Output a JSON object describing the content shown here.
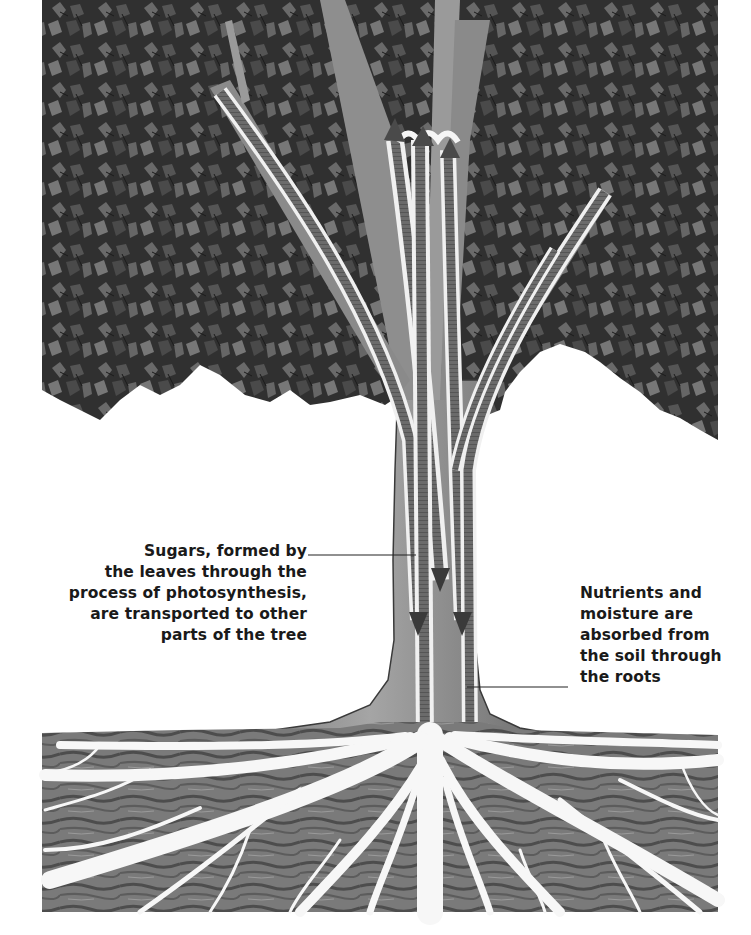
{
  "diagram": {
    "colors": {
      "background": "#ffffff",
      "canopy_dark": "#2a2a2a",
      "canopy_mid": "#555555",
      "canopy_light": "#7a7a7a",
      "trunk": "#8a8a8a",
      "vessel_dark": "#4a4a4a",
      "vessel_stripe": "#6f6f6f",
      "vessel_light": "#f2f2f2",
      "soil_dark": "#4d4d4d",
      "soil_mid": "#7b7b7b",
      "root": "#f7f7f7",
      "leader_line": "#222222",
      "text": "#1a1a1a"
    },
    "arrows": {
      "up": [
        "up-arrow-left",
        "up-arrow-center",
        "up-arrow-right"
      ],
      "down": [
        "down-arrow-left",
        "down-arrow-center",
        "down-arrow-right"
      ]
    }
  },
  "labels": {
    "sugars": {
      "lines": [
        "Sugars, formed by",
        "the leaves through the",
        "process of photosynthesis,",
        "are transported to other",
        "parts of the tree"
      ]
    },
    "nutrients": {
      "lines": [
        "Nutrients and",
        "moisture are",
        "absorbed from",
        "the soil through",
        "the roots"
      ]
    }
  }
}
